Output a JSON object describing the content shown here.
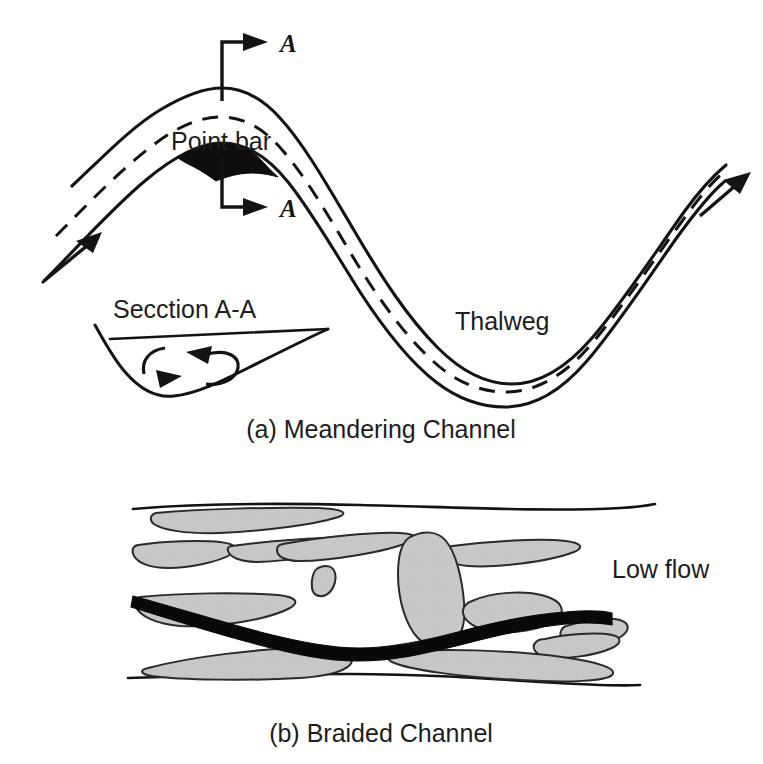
{
  "figure": {
    "background_color": "#ffffff",
    "ink_color": "#131313",
    "bar_fill_color": "#c8c8c8",
    "lowflow_color": "#090909"
  },
  "panel_a": {
    "caption": "(a) Meandering Channel",
    "labels": {
      "point_bar": "Point bar",
      "thalweg": "Thalweg",
      "section": "Secction A-A",
      "section_marker_top": "A",
      "section_marker_bottom": "A"
    },
    "elements": {
      "left_bank": "left-bank-line",
      "right_bank": "right-bank-line",
      "thalweg_line": "dashed-thalweg-line",
      "inflow_arrow": "flow-direction-arrow-inlet",
      "outflow_arrow": "flow-direction-arrow-outlet",
      "point_bar_deposit": "point-bar-deposit",
      "section_inset": "cross-section-inset",
      "secondary_circulation": "secondary-circulation-arrows"
    }
  },
  "panel_b": {
    "caption": "(b) Braided Channel",
    "labels": {
      "low_flow": "Low flow"
    },
    "elements": {
      "top_bank": "top-bank-line",
      "bottom_bank": "bottom-bank-line",
      "low_flow_channel": "low-flow-channel",
      "bar_count": 14
    },
    "bars": [
      {
        "id": "bar-1",
        "note": "upper-left elongate bar attached to top bank"
      },
      {
        "id": "bar-2",
        "note": "left mid lens bar"
      },
      {
        "id": "bar-3",
        "note": "upper mid elongate bar"
      },
      {
        "id": "bar-4",
        "note": "central large teardrop island"
      },
      {
        "id": "bar-5",
        "note": "upper right elongate bar"
      },
      {
        "id": "bar-6",
        "note": "small isolated ovoid bar"
      },
      {
        "id": "bar-7",
        "note": "mid-left elongate bar above low flow"
      },
      {
        "id": "bar-8",
        "note": "right oval bar above low flow"
      },
      {
        "id": "bar-9",
        "note": "right small tapered bar below low flow"
      },
      {
        "id": "bar-10",
        "note": "lower left elongate bar on bottom bank"
      },
      {
        "id": "bar-11",
        "note": "lower right elongate bar on bottom bank"
      },
      {
        "id": "bar-12",
        "note": "far right upper tapered bar"
      },
      {
        "id": "bar-13",
        "note": "mid-right slim bar"
      },
      {
        "id": "bar-14",
        "note": "left slim tapered bar"
      }
    ]
  }
}
